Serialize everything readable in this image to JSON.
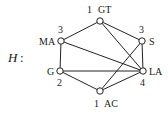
{
  "graph": {
    "name": "H",
    "separator": ":",
    "nodes": [
      {
        "id": "GT",
        "label": "GT",
        "number": "1",
        "x": 100,
        "y": 21
      },
      {
        "id": "S",
        "label": "S",
        "number": "3",
        "x": 142,
        "y": 41
      },
      {
        "id": "LA",
        "label": "LA",
        "number": "4",
        "x": 143,
        "y": 71
      },
      {
        "id": "AC",
        "label": "AC",
        "number": "1",
        "x": 100,
        "y": 91
      },
      {
        "id": "G",
        "label": "G",
        "number": "2",
        "x": 60,
        "y": 71
      },
      {
        "id": "MA",
        "label": "MA",
        "number": "3",
        "x": 61,
        "y": 41
      }
    ],
    "edges": [
      [
        "GT",
        "MA"
      ],
      [
        "GT",
        "S"
      ],
      [
        "GT",
        "LA"
      ],
      [
        "MA",
        "G"
      ],
      [
        "MA",
        "LA"
      ],
      [
        "S",
        "LA"
      ],
      [
        "S",
        "AC"
      ],
      [
        "G",
        "LA"
      ],
      [
        "G",
        "AC"
      ],
      [
        "AC",
        "LA"
      ]
    ]
  }
}
